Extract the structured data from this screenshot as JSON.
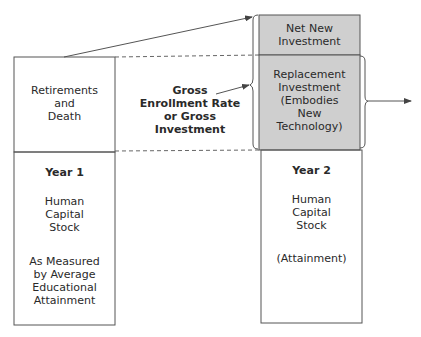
{
  "colors": {
    "shaded_fill": "#cfcfcf",
    "line": "#555555",
    "text": "#2a2a2a"
  },
  "year1": {
    "top_box": "Retirements\nand\nDeath",
    "title": "Year 1",
    "stock": "Human\nCapital\nStock",
    "measure": "As Measured\nby Average\nEducational\nAttainment"
  },
  "middle_label": "Gross\nEnrollment Rate\nor Gross\nInvestment",
  "year2": {
    "net_new": "Net New\nInvestment",
    "replacement": "Replacement\nInvestment\n(Embodies\nNew\nTechnology)",
    "title": "Year 2",
    "stock": "Human\nCapital\nStock",
    "measure": "(Attainment)"
  }
}
